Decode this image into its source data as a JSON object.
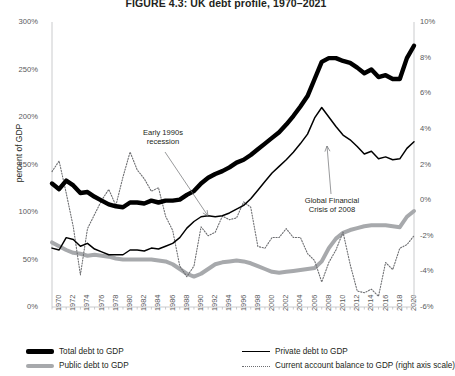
{
  "figure": {
    "title": "FIGURE 4.3: UK debt profile, 1970–2021",
    "ylabel_left": "percent of GDP"
  },
  "axes": {
    "left": {
      "ticks": [
        "0%",
        "50%",
        "100%",
        "150%",
        "200%",
        "250%",
        "300%"
      ],
      "min": 0,
      "max": 300
    },
    "right": {
      "ticks": [
        "-6%",
        "-4%",
        "-2%",
        "0%",
        "2%",
        "4%",
        "6%",
        "8%",
        "10%"
      ],
      "min": -6,
      "max": 10
    },
    "x": {
      "ticks": [
        "1970",
        "1972",
        "1974",
        "1976",
        "1978",
        "1980",
        "1982",
        "1984",
        "1986",
        "1988",
        "1990",
        "1992",
        "1994",
        "1996",
        "1998",
        "2000",
        "2002",
        "2004",
        "2006",
        "2008",
        "2010",
        "2012",
        "2014",
        "2016",
        "2018",
        "2020"
      ],
      "min": 1970,
      "max": 2021
    }
  },
  "annotations": [
    {
      "id": "early-1990s-recession",
      "line1": "Early 1990s",
      "line2": "recession"
    },
    {
      "id": "global-financial-crisis",
      "line1": "Global Financial",
      "line2": "Crisis of 2008"
    }
  ],
  "legend": [
    {
      "id": "total-debt",
      "label": "Total debt to GDP",
      "color": "#000000"
    },
    {
      "id": "public-debt",
      "label": "Public debt to GDP",
      "color": "#a7a9ac"
    },
    {
      "id": "private-debt",
      "label": "Private debt to GDP",
      "color": "#000000"
    },
    {
      "id": "current-account",
      "label": "Current account balance to GDP (right axis scale)",
      "color": "#6d6e71"
    }
  ],
  "chart_data": {
    "type": "line",
    "title": "FIGURE 4.3: UK debt profile, 1970–2021",
    "xlabel": "",
    "ylabel": "percent of GDP",
    "ylabel_right": "Current account balance to GDP",
    "ylim": [
      0,
      300
    ],
    "ylim_right": [
      -6,
      10
    ],
    "xlim": [
      1970,
      2021
    ],
    "grid": false,
    "legend_position": "bottom",
    "x": [
      1970,
      1971,
      1972,
      1973,
      1974,
      1975,
      1976,
      1977,
      1978,
      1979,
      1980,
      1981,
      1982,
      1983,
      1984,
      1985,
      1986,
      1987,
      1988,
      1989,
      1990,
      1991,
      1992,
      1993,
      1994,
      1995,
      1996,
      1997,
      1998,
      1999,
      2000,
      2001,
      2002,
      2003,
      2004,
      2005,
      2006,
      2007,
      2008,
      2009,
      2010,
      2011,
      2012,
      2013,
      2014,
      2015,
      2016,
      2017,
      2018,
      2019,
      2020,
      2021
    ],
    "series": [
      {
        "name": "Total debt to GDP",
        "axis": "left",
        "style": "thick-solid",
        "color": "#000000",
        "values": [
          130,
          124,
          133,
          128,
          120,
          121,
          116,
          112,
          108,
          106,
          105,
          110,
          110,
          109,
          112,
          110,
          112,
          112,
          113,
          118,
          122,
          130,
          136,
          140,
          143,
          147,
          152,
          155,
          160,
          166,
          172,
          178,
          184,
          192,
          201,
          211,
          222,
          240,
          258,
          262,
          262,
          259,
          257,
          252,
          246,
          250,
          242,
          244,
          240,
          240,
          262,
          275
        ]
      },
      {
        "name": "Public debt to GDP",
        "axis": "left",
        "style": "thick-grey",
        "color": "#a7a9ac",
        "values": [
          68,
          64,
          60,
          57,
          56,
          54,
          55,
          54,
          53,
          51,
          50,
          50,
          50,
          50,
          50,
          49,
          48,
          45,
          40,
          35,
          32,
          35,
          40,
          45,
          47,
          48,
          49,
          48,
          46,
          43,
          40,
          37,
          36,
          37,
          38,
          39,
          40,
          41,
          48,
          62,
          72,
          78,
          81,
          83,
          85,
          86,
          86,
          86,
          85,
          84,
          95,
          101
        ]
      },
      {
        "name": "Private debt to GDP",
        "axis": "left",
        "style": "thin-solid",
        "color": "#000000",
        "values": [
          62,
          60,
          73,
          71,
          64,
          67,
          61,
          58,
          55,
          55,
          55,
          60,
          60,
          59,
          62,
          61,
          64,
          67,
          73,
          83,
          90,
          95,
          96,
          95,
          96,
          99,
          103,
          107,
          114,
          123,
          132,
          141,
          148,
          155,
          163,
          172,
          182,
          199,
          210,
          200,
          190,
          181,
          176,
          169,
          161,
          164,
          156,
          158,
          155,
          156,
          167,
          174
        ]
      },
      {
        "name": "Current account balance to GDP (right axis scale)",
        "axis": "right",
        "style": "dotted",
        "color": "#6d6e71",
        "values": [
          1.6,
          2.2,
          0.4,
          -1.5,
          -4.2,
          -1.6,
          -0.8,
          0.0,
          0.6,
          -0.3,
          1.3,
          2.7,
          1.7,
          1.2,
          0.5,
          0.7,
          -0.9,
          -1.7,
          -3.7,
          -4.3,
          -3.7,
          -1.5,
          -2.0,
          -1.8,
          -0.9,
          -1.1,
          -1.0,
          -0.1,
          -0.4,
          -2.6,
          -2.7,
          -2.1,
          -2.1,
          -1.6,
          -2.1,
          -2.1,
          -3.0,
          -3.4,
          -4.6,
          -3.5,
          -2.8,
          -1.8,
          -3.6,
          -5.1,
          -5.2,
          -5.0,
          -5.4,
          -3.5,
          -3.9,
          -2.7,
          -2.5,
          -2.0
        ]
      }
    ]
  }
}
